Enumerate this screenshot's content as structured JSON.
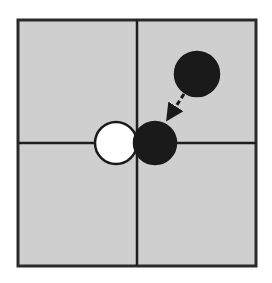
{
  "diagram": {
    "background": "#ffffff",
    "board": {
      "x": 18,
      "y": 20,
      "width": 238,
      "height": 246,
      "fill": "#cfcfcf",
      "stroke": "#2a2a2a",
      "stroke_width": 3
    },
    "grid": {
      "vertical_x": 137,
      "horizontal_y": 143,
      "stroke": "#1e1e1e",
      "stroke_width": 2.5
    },
    "stones": [
      {
        "name": "black-stone-source",
        "cx": 197,
        "cy": 74,
        "r": 22,
        "fill": "#1a1a1a",
        "stroke": "#1a1a1a"
      },
      {
        "name": "white-stone",
        "cx": 116,
        "cy": 143,
        "r": 21,
        "fill": "#ffffff",
        "stroke": "#1a1a1a"
      },
      {
        "name": "black-stone-target",
        "cx": 155,
        "cy": 143,
        "r": 21,
        "fill": "#1a1a1a",
        "stroke": "#1a1a1a"
      }
    ],
    "arrow": {
      "x1": 184,
      "y1": 94,
      "x2": 171,
      "y2": 114,
      "stroke": "#1a1a1a",
      "stroke_width": 3,
      "dash": "5,3",
      "head": "triangle"
    }
  }
}
